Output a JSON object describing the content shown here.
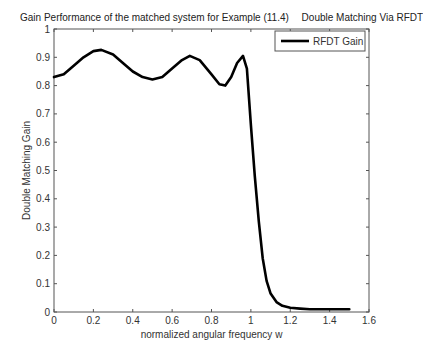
{
  "title": {
    "main": "Gain Performance of the matched system for Example (11.4)",
    "right": "Double Matching Via RFDT"
  },
  "chart_data": {
    "type": "line",
    "title": "Gain Performance of the matched system for Example (11.4)   Double Matching Via RFDT",
    "xlabel": "normalized angular frequency w",
    "ylabel": "Double Matching Gain",
    "xlim": [
      0,
      1.6
    ],
    "ylim": [
      0,
      1
    ],
    "xticks": [
      "0",
      "0.2",
      "0.4",
      "0.6",
      "0.8",
      "1",
      "1.2",
      "1.4",
      "1.6"
    ],
    "yticks": [
      "0",
      "0.1",
      "0.2",
      "0.3",
      "0.4",
      "0.5",
      "0.6",
      "0.7",
      "0.8",
      "0.9",
      "1"
    ],
    "grid": false,
    "legend": {
      "position": "upper right",
      "entries": [
        "RFDT Gain"
      ]
    },
    "series": [
      {
        "name": "RFDT Gain",
        "color": "#000000",
        "x": [
          0,
          0.05,
          0.1,
          0.15,
          0.2,
          0.24,
          0.3,
          0.35,
          0.4,
          0.45,
          0.5,
          0.55,
          0.6,
          0.65,
          0.69,
          0.74,
          0.8,
          0.84,
          0.87,
          0.9,
          0.93,
          0.96,
          0.98,
          1.0,
          1.02,
          1.04,
          1.06,
          1.08,
          1.1,
          1.13,
          1.16,
          1.2,
          1.25,
          1.3,
          1.4,
          1.5
        ],
        "y": [
          0.83,
          0.84,
          0.87,
          0.9,
          0.922,
          0.926,
          0.91,
          0.88,
          0.85,
          0.83,
          0.822,
          0.83,
          0.86,
          0.89,
          0.905,
          0.89,
          0.84,
          0.805,
          0.8,
          0.83,
          0.88,
          0.905,
          0.86,
          0.66,
          0.48,
          0.32,
          0.19,
          0.11,
          0.065,
          0.035,
          0.022,
          0.015,
          0.012,
          0.01,
          0.01,
          0.01
        ]
      }
    ]
  }
}
